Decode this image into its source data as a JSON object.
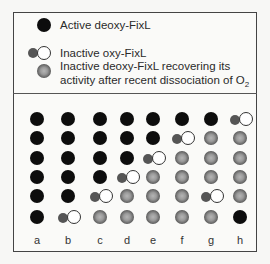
{
  "legend": [
    {
      "state": "active",
      "icon": "active-deoxy-fixl-icon",
      "label": "Active deoxy-FixL"
    },
    {
      "state": "oxy",
      "icon": "inactive-oxy-fixl-icon",
      "label": "Inactive oxy-FixL"
    },
    {
      "state": "recover",
      "icon": "recovering-deoxy-fixl-icon",
      "label_line1": "Inactive deoxy-FixL recovering its",
      "label_line2": "activity after recent dissociation of O",
      "label_sub": "2"
    }
  ],
  "columns": [
    "a",
    "b",
    "c",
    "d",
    "e",
    "f",
    "g",
    "h"
  ],
  "grid": {
    "a": [
      "active",
      "active",
      "active",
      "active",
      "active",
      "active"
    ],
    "b": [
      "active",
      "active",
      "active",
      "active",
      "active",
      "oxy"
    ],
    "c": [
      "active",
      "active",
      "active",
      "active",
      "oxy",
      "recover"
    ],
    "d": [
      "active",
      "active",
      "active",
      "oxy",
      "recover",
      "recover"
    ],
    "e": [
      "active",
      "active",
      "oxy",
      "recover",
      "recover",
      "recover"
    ],
    "f": [
      "active",
      "oxy",
      "recover",
      "recover",
      "recover",
      "recover"
    ],
    "g": [
      "active",
      "recover",
      "recover",
      "recover",
      "oxy",
      "recover"
    ],
    "h": [
      "oxy",
      "recover",
      "recover",
      "recover",
      "recover",
      "active"
    ]
  },
  "colors": {
    "active": "#0d0d0d",
    "heme": "#555555",
    "o2": "#ffffff",
    "border": "#444444"
  }
}
